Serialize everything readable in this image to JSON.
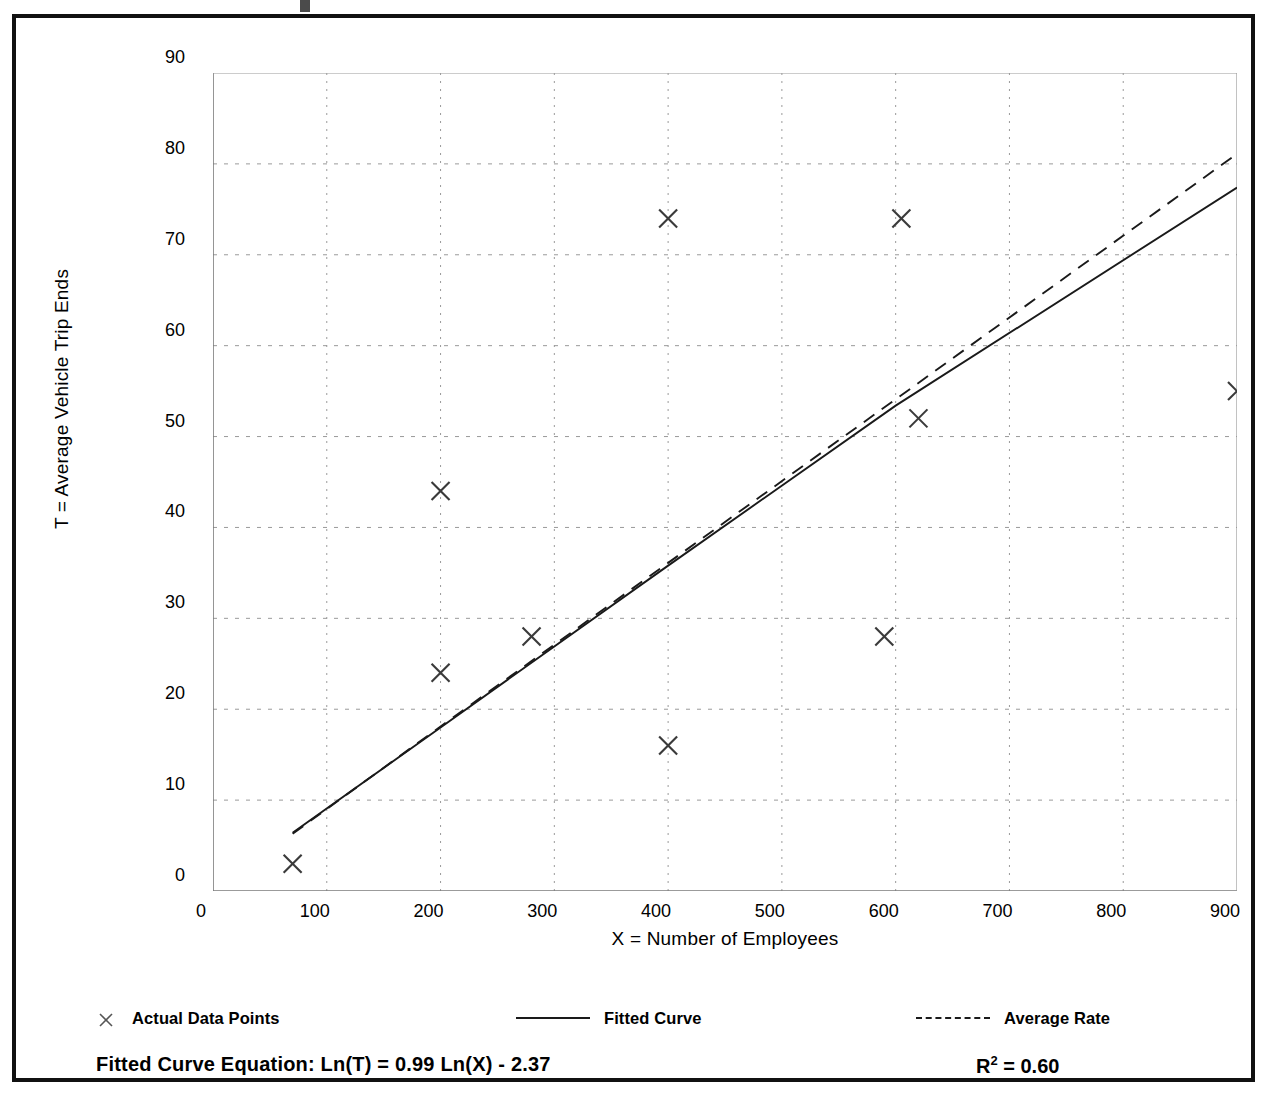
{
  "axes": {
    "ylabel": "T = Average Vehicle Trip Ends",
    "xlabel": "X = Number of Employees",
    "y_ticks": [
      "0",
      "10",
      "20",
      "30",
      "40",
      "50",
      "60",
      "70",
      "80",
      "90"
    ],
    "x_ticks": [
      "0",
      "100",
      "200",
      "300",
      "400",
      "500",
      "600",
      "700",
      "800",
      "900"
    ]
  },
  "legend": [
    {
      "label": "Actual Data Points",
      "swatch": "x-marker-icon"
    },
    {
      "label": "Fitted Curve",
      "swatch": "solid-line-icon"
    },
    {
      "label": "Average Rate",
      "swatch": "dashed-line-icon"
    }
  ],
  "footer": {
    "equation": "Fitted Curve Equation:  Ln(T) = 0.99 Ln(X) - 2.37",
    "r2_prefix": "R",
    "r2_exponent": "2",
    "r2_value": " = 0.60"
  },
  "colors": {
    "frame": "#111111",
    "axis": "#7a7a7a",
    "gridline": "#9a9a9a",
    "data_marker": "#3a3a3a",
    "fitted_curve": "#1a1a1a",
    "average_rate": "#1a1a1a"
  },
  "chart_data": {
    "type": "scatter",
    "title": "",
    "xlabel": "X = Number of Employees",
    "ylabel": "T = Average Vehicle Trip Ends",
    "xlim": [
      0,
      900
    ],
    "ylim": [
      0,
      90
    ],
    "x_ticks": [
      0,
      100,
      200,
      300,
      400,
      500,
      600,
      700,
      800,
      900
    ],
    "y_ticks": [
      0,
      10,
      20,
      30,
      40,
      50,
      60,
      70,
      80,
      90
    ],
    "x_minor_tick_interval": 50,
    "y_minor_tick_interval": 5,
    "grid": true,
    "grid_style": "dotted",
    "legend_position": "below-plot",
    "series": [
      {
        "name": "Actual Data Points",
        "type": "scatter",
        "marker": "x",
        "points": [
          {
            "x": 70,
            "y": 3
          },
          {
            "x": 200,
            "y": 44
          },
          {
            "x": 200,
            "y": 24
          },
          {
            "x": 280,
            "y": 28
          },
          {
            "x": 400,
            "y": 74
          },
          {
            "x": 400,
            "y": 16
          },
          {
            "x": 590,
            "y": 28
          },
          {
            "x": 605,
            "y": 74
          },
          {
            "x": 620,
            "y": 52
          },
          {
            "x": 900,
            "y": 55
          }
        ]
      },
      {
        "name": "Fitted Curve",
        "type": "line",
        "style": "solid",
        "equation": "Ln(T) = 0.99 Ln(X) - 2.37",
        "r_squared": 0.6,
        "points": [
          {
            "x": 70,
            "y": 6.4
          },
          {
            "x": 200,
            "y": 18.0
          },
          {
            "x": 400,
            "y": 35.8
          },
          {
            "x": 600,
            "y": 53.4
          },
          {
            "x": 900,
            "y": 77.4
          }
        ]
      },
      {
        "name": "Average Rate",
        "type": "line",
        "style": "dashed",
        "points": [
          {
            "x": 70,
            "y": 6.3
          },
          {
            "x": 200,
            "y": 18.1
          },
          {
            "x": 400,
            "y": 36.1
          },
          {
            "x": 600,
            "y": 54.1
          },
          {
            "x": 900,
            "y": 81.1
          }
        ]
      }
    ]
  }
}
